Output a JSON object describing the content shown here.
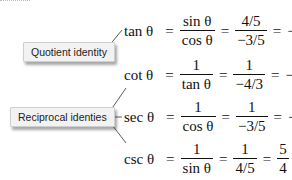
{
  "labels": {
    "quotient": "Quotient identity",
    "reciprocal": "Reciprocal identies"
  },
  "equations": [
    {
      "lhs": "tan θ",
      "f1_num": "sin θ",
      "f1_den": "cos θ",
      "f2_num": "4/5",
      "f2_den": "−3/5",
      "sign": "−",
      "f3_num": "4",
      "f3_den": "3"
    },
    {
      "lhs": "cot θ",
      "f1_num": "1",
      "f1_den": "tan θ",
      "f2_num": "1",
      "f2_den": "−4/3",
      "sign": "−",
      "f3_num": "3",
      "f3_den": "4"
    },
    {
      "lhs": "sec θ",
      "f1_num": "1",
      "f1_den": "cos θ",
      "f2_num": "1",
      "f2_den": "−3/5",
      "sign": "−",
      "f3_num": "5",
      "f3_den": "3"
    },
    {
      "lhs": "csc θ",
      "f1_num": "1",
      "f1_den": "sin θ",
      "f2_num": "1",
      "f2_den": "4/5",
      "sign": "",
      "f3_num": "5",
      "f3_den": "4"
    }
  ],
  "equals_sign": "="
}
